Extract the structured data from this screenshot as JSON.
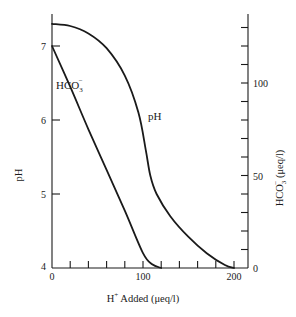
{
  "chart_data": {
    "type": "line",
    "title": "",
    "xlabel": "H+ Added (μeq/l)",
    "xlabel_parts": {
      "base": "H",
      "sup": "+",
      "rest": " Added  (μeq/l)"
    },
    "ylabel": "pH",
    "y2label": "HCO3- (μeq/l)",
    "y2label_parts": {
      "base": "HCO",
      "sub": "3",
      "sup": "−",
      "rest": "  (μeq/l)"
    },
    "xlim": [
      0,
      200
    ],
    "ylim": [
      4,
      7.4
    ],
    "y2lim": [
      0,
      140
    ],
    "x_ticks": [
      0,
      100,
      200
    ],
    "x_minor_ticks": [
      20,
      40,
      60,
      80,
      120,
      140,
      160,
      180
    ],
    "y_ticks": [
      4,
      5,
      6,
      7
    ],
    "y2_ticks": [
      0,
      50,
      100
    ],
    "y2_minor_ticks": [
      10,
      20,
      30,
      40,
      60,
      70,
      80,
      90,
      110,
      120,
      130
    ],
    "grid": false,
    "legend": "none (curves labeled inline)",
    "series": [
      {
        "name": "pH",
        "axis": "left",
        "label": "pH",
        "x": [
          0,
          20,
          40,
          60,
          80,
          95,
          103,
          108,
          115,
          130,
          150,
          170,
          190,
          200
        ],
        "values": [
          7.3,
          7.27,
          7.17,
          6.97,
          6.6,
          6.1,
          5.6,
          5.25,
          5.0,
          4.7,
          4.42,
          4.2,
          4.04,
          4.0
        ]
      },
      {
        "name": "HCO3-",
        "axis": "right",
        "label": "HCO3-",
        "label_parts": {
          "base": "HCO",
          "sub": "3",
          "sup": "−"
        },
        "x": [
          0,
          20,
          40,
          60,
          80,
          100,
          110,
          120
        ],
        "values": [
          120,
          98,
          75,
          53,
          31,
          8,
          2,
          0
        ]
      }
    ]
  }
}
